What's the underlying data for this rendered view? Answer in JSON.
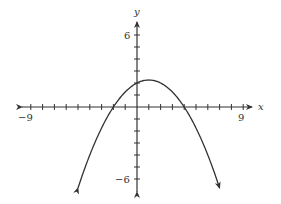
{
  "chart_data": {
    "type": "line",
    "title": "",
    "xlabel": "x",
    "ylabel": "y",
    "x_tick_labels": [
      "-9",
      "9"
    ],
    "y_tick_labels": [
      "6",
      "-6"
    ],
    "xlim": [
      -9,
      9
    ],
    "ylim": [
      -6,
      6
    ],
    "grid": false,
    "legend": null,
    "series": [
      {
        "name": "parabola",
        "equation": "y = -0.25(x + 2)(x - 4)",
        "x": [
          -5,
          -4,
          -3,
          -2,
          -1,
          0,
          1,
          2,
          3,
          4,
          5,
          6,
          7
        ],
        "y": [
          -6.75,
          -4,
          -1.75,
          0,
          1.25,
          2,
          2.25,
          2,
          1.25,
          0,
          -1.75,
          -4,
          -6.75
        ]
      }
    ],
    "annotations": {
      "x_intercepts": [
        -2,
        4
      ],
      "y_intercept": 2,
      "vertex": [
        1,
        2.25
      ],
      "curve_ends_with_arrows": true
    }
  },
  "labels": {
    "x_axis": "x",
    "y_axis": "y",
    "x_min": "−9",
    "x_max": "9",
    "y_max": "6",
    "y_min": "−6"
  }
}
